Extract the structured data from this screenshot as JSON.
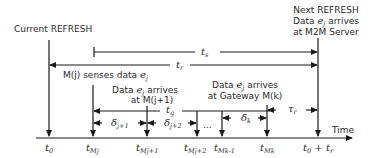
{
  "labels": {
    "current_refresh": "Current REFRESH",
    "next_refresh_1": "Next REFRESH",
    "next_refresh_2a": "Data ",
    "next_refresh_2e": "e",
    "next_refresh_2j": "j",
    "next_refresh_2b": " arrives",
    "next_refresh_3": "at M2M Server",
    "senses": "M(j) senses data ",
    "senses_e": "e",
    "senses_j": "j",
    "arrive_j1_a": "Data ",
    "arrive_j1_e": "e",
    "arrive_j1_j": "j",
    "arrive_j1_b": " arrives",
    "arrive_j1_2": "at M(j+1)",
    "arrive_k_a": "Data ",
    "arrive_k_e": "e",
    "arrive_k_j": "j",
    "arrive_k_b": " arrives",
    "arrive_k_2": "at Gateway M(k)",
    "time_axis": "Time",
    "ellipsis": "..."
  },
  "intervals": {
    "ts": {
      "sym": "t",
      "sub": "s"
    },
    "tr": {
      "sym": "t",
      "sub": "r"
    },
    "tg": {
      "sym": "t",
      "sub": "g"
    },
    "tau_r": {
      "sym": "τ",
      "sub": "r"
    },
    "delta_j1": {
      "sym": "δ",
      "sub": "j+1"
    },
    "delta_j2": {
      "sym": "δ",
      "sub": "j+2"
    },
    "delta_k": {
      "sym": "δ",
      "sub": "k"
    }
  },
  "ticks": [
    {
      "sym": "t",
      "sub": "0"
    },
    {
      "sym": "t",
      "sub": "Mj"
    },
    {
      "sym": "t",
      "sub": "Mj+1"
    },
    {
      "sym": "t",
      "sub": "Mj+2"
    },
    {
      "sym": "t",
      "sub": "Mk-1"
    },
    {
      "sym": "t",
      "sub": "Mk"
    },
    {
      "sym": "t",
      "sub": "0",
      "suffix": " + ",
      "sym2": "t",
      "sub2": "r"
    }
  ]
}
